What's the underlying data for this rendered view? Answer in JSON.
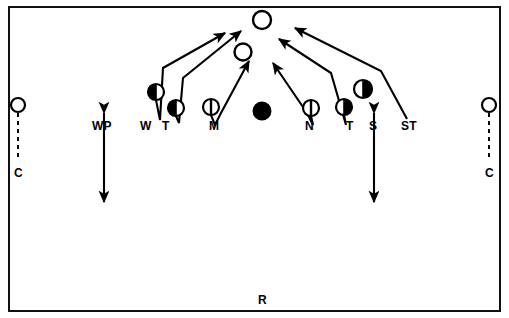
{
  "diagram": {
    "field": {
      "border_color": "#111111",
      "background": "#ffffff",
      "width": 493,
      "height": 306
    },
    "ink_color": "#000000",
    "returner_label": "R",
    "labels": [
      {
        "id": "corner-left",
        "text": "C",
        "x": 14,
        "y": 167
      },
      {
        "id": "wp-left",
        "text": "WP",
        "x": 92,
        "y": 120
      },
      {
        "id": "will",
        "text": "W",
        "x": 140,
        "y": 120
      },
      {
        "id": "tackle-left",
        "text": "T",
        "x": 162,
        "y": 120
      },
      {
        "id": "mike",
        "text": "M",
        "x": 209,
        "y": 120
      },
      {
        "id": "nose",
        "text": "N",
        "x": 305,
        "y": 120
      },
      {
        "id": "tackle-right",
        "text": "T",
        "x": 346,
        "y": 120
      },
      {
        "id": "sam",
        "text": "S",
        "x": 369,
        "y": 120
      },
      {
        "id": "strong-tackle",
        "text": "ST",
        "x": 401,
        "y": 120
      },
      {
        "id": "returner",
        "text": "R",
        "x": 258,
        "y": 294
      },
      {
        "id": "corner-right",
        "text": "C",
        "x": 485,
        "y": 167
      }
    ],
    "players": [
      {
        "id": "corner-left",
        "marker": "open-circle",
        "x": 18,
        "y": 105,
        "r": 7
      },
      {
        "id": "will",
        "marker": "left-half-filled",
        "x": 156,
        "y": 92,
        "r": 8
      },
      {
        "id": "tackle-left",
        "marker": "left-half-filled",
        "x": 176,
        "y": 108,
        "r": 8
      },
      {
        "id": "mike",
        "marker": "vertical-split",
        "x": 211,
        "y": 107,
        "r": 8
      },
      {
        "id": "center-ball",
        "marker": "solid-circle",
        "x": 262,
        "y": 111,
        "r": 8
      },
      {
        "id": "nose",
        "marker": "vertical-split",
        "x": 311,
        "y": 108,
        "r": 8
      },
      {
        "id": "tackle-right",
        "marker": "right-half-filled",
        "x": 344,
        "y": 107,
        "r": 8
      },
      {
        "id": "sam",
        "marker": "right-half-filled",
        "x": 363,
        "y": 89,
        "r": 9
      },
      {
        "id": "corner-right",
        "marker": "open-circle",
        "x": 489,
        "y": 105,
        "r": 7
      },
      {
        "id": "blocker-deep",
        "marker": "open-circle",
        "x": 262,
        "y": 20,
        "r": 9
      },
      {
        "id": "blocker-front",
        "marker": "open-circle",
        "x": 243,
        "y": 52,
        "r": 8
      }
    ],
    "routes": [
      {
        "id": "will-route",
        "from": "will",
        "to": "blocker-deep",
        "points": "156,100 160,118 163,68 224,32"
      },
      {
        "id": "tackle-left-route",
        "from": "tackle-left",
        "to": "blocker-deep",
        "points": "176,117 178,122 182,78 240,30"
      },
      {
        "id": "mike-route",
        "from": "mike",
        "to": "blocker-front",
        "points": "211,116 214,124 220,112 248,60"
      },
      {
        "id": "nose-route",
        "from": "nose",
        "to": "blocker-deep",
        "points": "311,117 312,124 306,112 272,62"
      },
      {
        "id": "tackle-right-route",
        "from": "tackle-right",
        "to": "blocker-deep",
        "points": "344,116 345,124 330,72 277,38"
      },
      {
        "id": "strong-tackle-route",
        "from": "strong-tackle",
        "to": "blocker-deep",
        "points": "406,118 380,70 293,27"
      }
    ],
    "coverage_arrows": [
      {
        "id": "wp-vertical-arrow",
        "x": 104,
        "y1": 112,
        "y2": 203
      },
      {
        "id": "s-vertical-arrow",
        "x": 374,
        "y1": 112,
        "y2": 203
      }
    ],
    "dashed_drops": [
      {
        "id": "corner-left-drop",
        "x": 18,
        "y1": 113,
        "y2": 160
      },
      {
        "id": "corner-right-drop",
        "x": 489,
        "y1": 113,
        "y2": 160
      }
    ]
  }
}
